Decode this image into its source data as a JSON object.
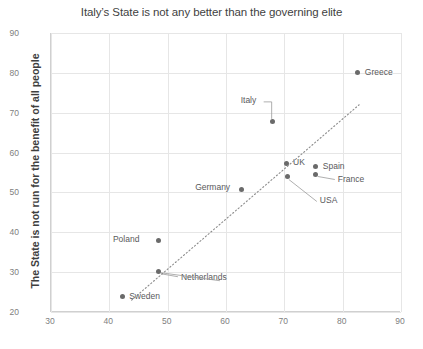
{
  "chart_data": {
    "type": "scatter",
    "title": "Italy’s State is not any better than the governing elite",
    "xlabel": "",
    "ylabel": "The State is not run for the benefit of all people",
    "xlim": [
      30,
      90
    ],
    "ylim": [
      20,
      90
    ],
    "xticks": [
      30,
      40,
      50,
      60,
      70,
      80,
      90
    ],
    "yticks": [
      20,
      30,
      40,
      50,
      60,
      70,
      80,
      90
    ],
    "grid": true,
    "legend": "none",
    "point_color": "#6a6a6a",
    "gridline_color": "#e6e6e6",
    "trendline": {
      "style": "dotted",
      "color": "#8c8c8c",
      "x_start": 44.0,
      "y_start": 23.0,
      "x_end": 83.0,
      "y_end": 72.0
    },
    "points": [
      {
        "label": "Greece",
        "x": 82.6,
        "y": 80.0,
        "label_side": "right"
      },
      {
        "label": "Italy",
        "x": 68.0,
        "y": 67.7,
        "label_side": "leader-up-left"
      },
      {
        "label": "UK",
        "x": 70.3,
        "y": 57.3,
        "label_side": "right"
      },
      {
        "label": "Spain",
        "x": 75.4,
        "y": 56.5,
        "label_side": "right"
      },
      {
        "label": "France",
        "x": 75.4,
        "y": 54.5,
        "label_side": "leader-right"
      },
      {
        "label": "USA",
        "x": 70.6,
        "y": 54.0,
        "label_side": "leader-down-right"
      },
      {
        "label": "Germany",
        "x": 62.6,
        "y": 50.8,
        "label_side": "left"
      },
      {
        "label": "Poland",
        "x": 48.5,
        "y": 37.9,
        "label_side": "left"
      },
      {
        "label": "Netherlands",
        "x": 48.5,
        "y": 30.1,
        "label_side": "leader-right"
      },
      {
        "label": "Sweden",
        "x": 42.2,
        "y": 23.8,
        "label_side": "right"
      }
    ]
  }
}
